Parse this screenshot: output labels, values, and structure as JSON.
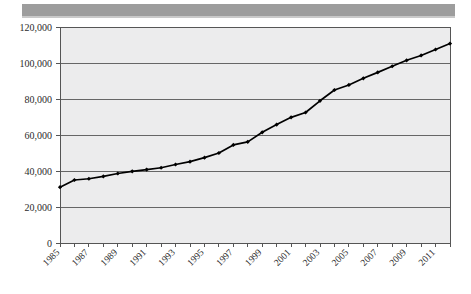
{
  "figure": {
    "kind": "line-chart-scan",
    "top_bar_color": "#9d9d9d",
    "plot_background": "#ececed",
    "gridline_color": "#666666",
    "axis_color": "#555555",
    "series_color": "#000000"
  },
  "chart_data": {
    "type": "line",
    "title": "",
    "subtitle": "",
    "xlabel": "",
    "ylabel": "",
    "grid": true,
    "legend": false,
    "legend_position": "none",
    "xlim": [
      1985,
      2012
    ],
    "ylim": [
      0,
      120000
    ],
    "ytick_step": 20000,
    "ytick_labels": [
      "120,000",
      "100,000",
      "80,000",
      "60,000",
      "40,000",
      "20,000",
      "0"
    ],
    "ytick_values": [
      120000,
      100000,
      80000,
      60000,
      40000,
      20000,
      0
    ],
    "xtick_labels": [
      "1985",
      "1987",
      "1989",
      "1991",
      "1993",
      "1995",
      "1997",
      "1999",
      "2001",
      "2003",
      "2005",
      "2007",
      "2009",
      "2011"
    ],
    "xtick_values": [
      1985,
      1987,
      1989,
      1991,
      1993,
      1995,
      1997,
      1999,
      2001,
      2003,
      2005,
      2007,
      2009,
      2011
    ],
    "marker": "diamond",
    "categories": [
      1985,
      1986,
      1987,
      1988,
      1989,
      1990,
      1991,
      1992,
      1993,
      1994,
      1995,
      1996,
      1997,
      1998,
      1999,
      2000,
      2001,
      2002,
      2003,
      2004,
      2005,
      2006,
      2007,
      2008,
      2009,
      2010,
      2011,
      2012
    ],
    "values": [
      31000,
      35000,
      35700,
      37000,
      38600,
      39800,
      40800,
      41800,
      43600,
      45200,
      47400,
      50000,
      54500,
      56200,
      61500,
      65800,
      69800,
      72500,
      79000,
      85000,
      87800,
      91500,
      94800,
      98200,
      101500,
      104200,
      107500,
      110800
    ],
    "series": [
      {
        "name": "series-1",
        "values": [
          31000,
          35000,
          35700,
          37000,
          38600,
          39800,
          40800,
          41800,
          43600,
          45200,
          47400,
          50000,
          54500,
          56200,
          61500,
          65800,
          69800,
          72500,
          79000,
          85000,
          87800,
          91500,
          94800,
          98200,
          101500,
          104200,
          107500,
          110800
        ]
      }
    ]
  }
}
